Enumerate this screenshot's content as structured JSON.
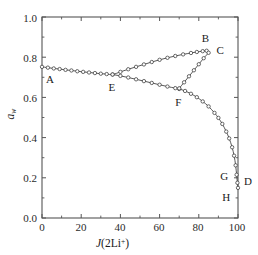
{
  "chart_data": {
    "type": "line",
    "title": "",
    "xlabel": "J(2Li+)",
    "xlabel_parts": {
      "italic": "J",
      "rest": "(2Li",
      "sup": "+",
      "close": ")"
    },
    "ylabel": "a_w",
    "ylabel_parts": {
      "italic": "a",
      "sub": "w"
    },
    "xlim": [
      0,
      100
    ],
    "ylim": [
      0.0,
      1.0
    ],
    "xticks": [
      "0",
      "20",
      "40",
      "60",
      "80",
      "100"
    ],
    "xtick_values": [
      0,
      20,
      40,
      60,
      80,
      100
    ],
    "yticks": [
      "0.0",
      "0.2",
      "0.4",
      "0.6",
      "0.8",
      "1.0"
    ],
    "ytick_values": [
      0.0,
      0.2,
      0.4,
      0.6,
      0.8,
      1.0
    ],
    "grid": false,
    "legend": "none",
    "marker": "open-circle",
    "line_color": "#3a3a3a",
    "marker_color": "#3a3a3a",
    "axis_color": "#555555",
    "series": [
      {
        "name": "branch-A-E-B",
        "points": [
          [
            0.0,
            0.752
          ],
          [
            3.0,
            0.748
          ],
          [
            6.0,
            0.744
          ],
          [
            9.0,
            0.741
          ],
          [
            12.0,
            0.737
          ],
          [
            15.0,
            0.734
          ],
          [
            18.0,
            0.73
          ],
          [
            21.0,
            0.727
          ],
          [
            24.0,
            0.724
          ],
          [
            27.0,
            0.721
          ],
          [
            30.0,
            0.718
          ],
          [
            33.0,
            0.716
          ],
          [
            36.0,
            0.714
          ],
          [
            40.0,
            0.727
          ],
          [
            44.0,
            0.74
          ],
          [
            48.0,
            0.752
          ],
          [
            52.0,
            0.764
          ],
          [
            56.0,
            0.776
          ],
          [
            60.0,
            0.787
          ],
          [
            64.0,
            0.797
          ],
          [
            68.0,
            0.806
          ],
          [
            72.0,
            0.814
          ],
          [
            76.0,
            0.821
          ],
          [
            79.0,
            0.826
          ],
          [
            82.0,
            0.83
          ],
          [
            84.0,
            0.832
          ]
        ]
      },
      {
        "name": "branch-E-F-G-D",
        "points": [
          [
            36.0,
            0.714
          ],
          [
            40.0,
            0.707
          ],
          [
            44.0,
            0.699
          ],
          [
            48.0,
            0.69
          ],
          [
            52.0,
            0.681
          ],
          [
            56.0,
            0.672
          ],
          [
            60.0,
            0.663
          ],
          [
            64.0,
            0.654
          ],
          [
            68.0,
            0.646
          ],
          [
            70.0,
            0.642
          ],
          [
            73.0,
            0.632
          ],
          [
            76.0,
            0.618
          ],
          [
            79.0,
            0.601
          ],
          [
            82.0,
            0.58
          ],
          [
            85.0,
            0.555
          ],
          [
            88.0,
            0.523
          ],
          [
            90.0,
            0.498
          ],
          [
            92.0,
            0.468
          ],
          [
            94.0,
            0.43
          ],
          [
            95.5,
            0.396
          ],
          [
            97.0,
            0.352
          ],
          [
            98.0,
            0.31
          ],
          [
            98.8,
            0.262
          ],
          [
            99.3,
            0.215
          ],
          [
            99.7,
            0.175
          ],
          [
            100.0,
            0.15
          ]
        ]
      },
      {
        "name": "tie-line-F-C",
        "points": [
          [
            70.0,
            0.645
          ],
          [
            72.5,
            0.675
          ],
          [
            75.0,
            0.705
          ],
          [
            77.5,
            0.735
          ],
          [
            80.0,
            0.765
          ],
          [
            82.5,
            0.795
          ],
          [
            85.0,
            0.822
          ]
        ]
      }
    ],
    "annotations": [
      {
        "label": "A",
        "x": 2.5,
        "y": 0.752,
        "dx": -1,
        "dy": 13
      },
      {
        "label": "B",
        "x": 82.0,
        "y": 0.836,
        "dx": -1,
        "dy": -11
      },
      {
        "label": "C",
        "x": 85.5,
        "y": 0.822,
        "dx": 7,
        "dy": -2
      },
      {
        "label": "D",
        "x": 100.0,
        "y": 0.172,
        "dx": 6,
        "dy": -1
      },
      {
        "label": "E",
        "x": 35.0,
        "y": 0.712,
        "dx": -2,
        "dy": 13
      },
      {
        "label": "F",
        "x": 69.0,
        "y": 0.64,
        "dx": -2,
        "dy": 14
      },
      {
        "label": "G",
        "x": 92.0,
        "y": 0.205,
        "dx": -2,
        "dy": 0
      },
      {
        "label": "H",
        "x": 93.0,
        "y": 0.148,
        "dx": -2,
        "dy": 10
      }
    ]
  }
}
